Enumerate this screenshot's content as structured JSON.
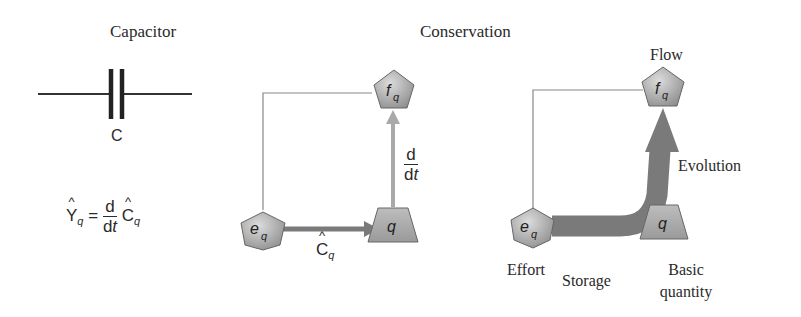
{
  "panels": {
    "capacitor": {
      "title": "Capacitor",
      "component_label": "C",
      "formula": {
        "lhs": "Y",
        "lhs_sub": "q",
        "equals": "=",
        "frac_num": "d",
        "frac_den_d": "d",
        "frac_den_t": "t",
        "rhs": "C",
        "rhs_sub": "q"
      }
    },
    "conservation": {
      "title": "Conservation",
      "nodes": {
        "flow": {
          "symbol": "f",
          "sub": "q"
        },
        "effort": {
          "symbol": "e",
          "sub": "q"
        },
        "quantity": {
          "symbol": "q"
        }
      },
      "edges": {
        "storage": {
          "label": "C",
          "label_sub": "q"
        },
        "derivative": {
          "num": "d",
          "den_d": "d",
          "den_t": "t"
        }
      }
    },
    "semantic": {
      "labels": {
        "flow": "Flow",
        "evolution": "Evolution",
        "effort": "Effort",
        "storage": "Storage",
        "basic_1": "Basic",
        "basic_2": "quantity"
      },
      "nodes": {
        "flow": {
          "symbol": "f",
          "sub": "q"
        },
        "effort": {
          "symbol": "e",
          "sub": "q"
        },
        "quantity": {
          "symbol": "q"
        }
      }
    }
  },
  "colors": {
    "node_fill_light": "#c8c8c8",
    "node_fill_dark": "#8a8a8a",
    "arrow_gray": "#7a7a7a",
    "light_arrow": "#a8a8a8",
    "line": "#777777",
    "text": "#2a2a2a"
  }
}
